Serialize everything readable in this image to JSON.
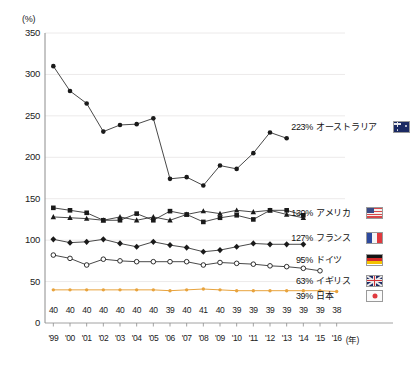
{
  "axes": {
    "y_unit": "(%)",
    "y_ticks": [
      "350",
      "300",
      "250",
      "200",
      "150",
      "100",
      "50",
      "0"
    ],
    "x_unit": "(年)",
    "x_ticks": [
      "'99",
      "'00",
      "'01",
      "'02",
      "'03",
      "'04",
      "'05",
      "'06",
      "'07",
      "'08",
      "'09",
      "'10",
      "'11",
      "'12",
      "'13",
      "'14",
      "'15",
      "'16"
    ]
  },
  "legend": [
    {
      "value": "223%",
      "name": "オーストラリア",
      "flag": "australia-flag-icon",
      "color": "#1a1a1a"
    },
    {
      "value": "130%",
      "name": "アメリカ",
      "flag": "usa-flag-icon",
      "color": "#1a1a1a"
    },
    {
      "value": "127%",
      "name": "フランス",
      "flag": "france-flag-icon",
      "color": "#1a1a1a"
    },
    {
      "value": "95%",
      "name": "ドイツ",
      "flag": "germany-flag-icon",
      "color": "#1a1a1a"
    },
    {
      "value": "63%",
      "name": "イギリス",
      "flag": "uk-flag-icon",
      "color": "#1a1a1a"
    },
    {
      "value": "39%",
      "name": "日本",
      "flag": "japan-flag-icon",
      "color": "#e8a33d"
    }
  ],
  "japan_point_labels": [
    "40",
    "40",
    "40",
    "40",
    "40",
    "40",
    "40",
    "39",
    "40",
    "41",
    "40",
    "39",
    "39",
    "39",
    "39",
    "39",
    "39",
    "38"
  ],
  "chart_data": {
    "type": "line",
    "title": "",
    "xlabel": "(年)",
    "ylabel": "(%)",
    "ylim": [
      0,
      350
    ],
    "grid": true,
    "legend_position": "right",
    "x": [
      "'99",
      "'00",
      "'01",
      "'02",
      "'03",
      "'04",
      "'05",
      "'06",
      "'07",
      "'08",
      "'09",
      "'10",
      "'11",
      "'12",
      "'13",
      "'14",
      "'15",
      "'16"
    ],
    "series": [
      {
        "name": "オーストラリア",
        "label_en": "Australia",
        "marker": "filled-circle",
        "color": "#1a1a1a",
        "end_value": 223,
        "values": [
          310,
          280,
          265,
          231,
          239,
          240,
          247,
          174,
          176,
          166,
          190,
          186,
          205,
          230,
          223,
          null,
          null,
          null
        ]
      },
      {
        "name": "アメリカ",
        "label_en": "United States",
        "marker": "filled-square",
        "color": "#1a1a1a",
        "end_value": 130,
        "values": [
          139,
          136,
          133,
          124,
          124,
          132,
          124,
          135,
          131,
          122,
          127,
          130,
          125,
          136,
          136,
          130,
          null,
          null
        ]
      },
      {
        "name": "フランス",
        "label_en": "France",
        "marker": "filled-triangle",
        "color": "#1a1a1a",
        "end_value": 127,
        "values": [
          128,
          127,
          126,
          124,
          128,
          124,
          128,
          124,
          131,
          135,
          132,
          136,
          134,
          136,
          131,
          127,
          null,
          null
        ]
      },
      {
        "name": "ドイツ",
        "label_en": "Germany",
        "marker": "filled-diamond",
        "color": "#1a1a1a",
        "end_value": 95,
        "values": [
          101,
          97,
          98,
          101,
          96,
          92,
          98,
          94,
          91,
          86,
          88,
          92,
          96,
          95,
          95,
          95,
          null,
          null
        ]
      },
      {
        "name": "イギリス",
        "label_en": "United Kingdom",
        "marker": "open-circle",
        "color": "#1a1a1a",
        "end_value": 63,
        "values": [
          82,
          78,
          70,
          77,
          75,
          74,
          74,
          74,
          74,
          70,
          73,
          72,
          71,
          69,
          68,
          66,
          63,
          null
        ]
      },
      {
        "name": "日本",
        "label_en": "Japan",
        "marker": "small-filled-circle",
        "color": "#e8a33d",
        "end_value": 39,
        "values": [
          40,
          40,
          40,
          40,
          40,
          40,
          40,
          39,
          40,
          41,
          40,
          39,
          39,
          39,
          39,
          39,
          39,
          38
        ]
      }
    ]
  }
}
